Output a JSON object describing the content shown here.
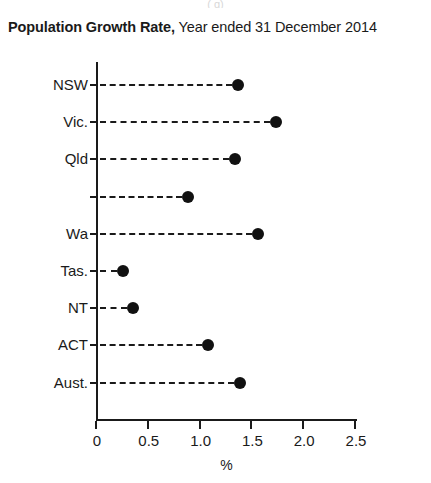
{
  "title": {
    "bold_part": "Population Growth Rate,",
    "regular_part": " Year ended 31 December 2014"
  },
  "top_artifact_text": "( g)",
  "colors": {
    "background": "#ffffff",
    "axis": "#1a1a1a",
    "dot": "#111111",
    "text": "#1a1a1a"
  },
  "chart_data": {
    "type": "scatter",
    "title": "Population Growth Rate, Year ended 31 December 2014",
    "subtitle": "",
    "xlabel": "%",
    "ylabel": "",
    "xlim": [
      0,
      2.5
    ],
    "xticks": [
      "0",
      "0.5",
      "1.0",
      "1.5",
      "2.0",
      "2.5"
    ],
    "xtick_values": [
      0,
      0.5,
      1.0,
      1.5,
      2.0,
      2.5
    ],
    "grid": false,
    "legend": "none",
    "orientation": "horizontal",
    "marker": "filled-circle",
    "leader_line_style": "dashed",
    "categories": [
      "NSW",
      "Vic.",
      "Qld",
      "",
      "Wa",
      "Tas.",
      "NT",
      "ACT",
      "Aust."
    ],
    "values": [
      1.37,
      1.74,
      1.34,
      0.89,
      1.56,
      0.26,
      0.36,
      1.08,
      1.39
    ],
    "points": [
      {
        "category": "NSW",
        "value": 1.37
      },
      {
        "category": "Vic.",
        "value": 1.74
      },
      {
        "category": "Qld",
        "value": 1.34
      },
      {
        "category": "",
        "value": 0.89
      },
      {
        "category": "Wa",
        "value": 1.56
      },
      {
        "category": "Tas.",
        "value": 0.26
      },
      {
        "category": "NT",
        "value": 0.36
      },
      {
        "category": "ACT",
        "value": 1.08
      },
      {
        "category": "Aust.",
        "value": 1.39
      }
    ]
  }
}
